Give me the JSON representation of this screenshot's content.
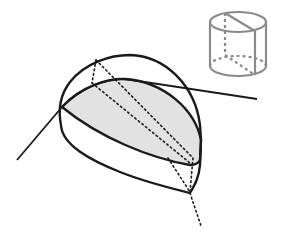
{
  "diagram": {
    "colors": {
      "stroke": "#1a1a1a",
      "section_fill": "#e2e2e2",
      "inset_stroke": "#8a8a8a",
      "background": "#ffffff"
    },
    "elements": [
      "main-cut-solid",
      "shaded-section-plane",
      "intersecting-line",
      "hidden-dotted-edges",
      "inset-cylinder"
    ]
  }
}
